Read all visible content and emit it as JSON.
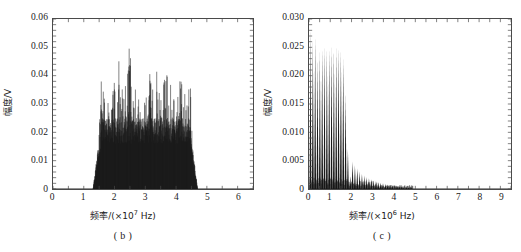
{
  "figure": {
    "background": "#ffffff",
    "axis_color": "#4a4a4a",
    "trace_color": "#1a1a1a"
  },
  "panels": [
    {
      "id": "b",
      "caption": "( b )",
      "ylabel": "幅度/V",
      "xlabel_prefix": "频率/(×10",
      "xlabel_exp": "7",
      "xlabel_suffix": " Hz)",
      "yticks": [
        "0",
        "0.01",
        "0.02",
        "0.03",
        "0.04",
        "0.05",
        "0.06"
      ],
      "xticks": [
        "0",
        "1",
        "2",
        "3",
        "4",
        "5",
        "6"
      ]
    },
    {
      "id": "c",
      "caption": "( c )",
      "ylabel": "幅度/V",
      "xlabel_prefix": "频率/(×10",
      "xlabel_exp": "6",
      "xlabel_suffix": " Hz)",
      "yticks": [
        "0",
        "0.005",
        "0.010",
        "0.015",
        "0.020",
        "0.025",
        "0.030"
      ],
      "xticks": [
        "0",
        "1",
        "2",
        "3",
        "4",
        "5",
        "6",
        "7",
        "8",
        "9"
      ]
    }
  ],
  "chart_data": [
    {
      "type": "line",
      "panel": "b",
      "title": "( b )",
      "xlabel": "频率/(×10^7 Hz)",
      "ylabel": "幅度/V",
      "xlim": [
        0,
        6.5
      ],
      "ylim": [
        0,
        0.06
      ],
      "xticks": [
        0,
        1,
        2,
        3,
        4,
        5,
        6
      ],
      "yticks": [
        0,
        0.01,
        0.02,
        0.03,
        0.04,
        0.05,
        0.06
      ],
      "grid": false,
      "legend": "none",
      "description": "Dense spectral comb occupying roughly 1.3e7 to 4.7e7 Hz with a filled noise pedestal rising near the band edges and many sharp spikes reaching 0.03-0.050 V. A slight central dip occurs near 3e7 Hz.",
      "band": [
        1.3,
        4.7
      ],
      "peak_value": 0.05,
      "peak_x": 2.52,
      "x": [
        1.3,
        1.34,
        1.38,
        1.42,
        1.46,
        1.5,
        1.54,
        1.58,
        1.62,
        1.66,
        1.7,
        1.74,
        1.78,
        1.82,
        1.86,
        1.9,
        1.94,
        1.98,
        2.02,
        2.06,
        2.1,
        2.14,
        2.18,
        2.22,
        2.26,
        2.3,
        2.34,
        2.38,
        2.42,
        2.46,
        2.5,
        2.54,
        2.58,
        2.62,
        2.66,
        2.7,
        2.74,
        2.78,
        2.82,
        2.86,
        2.9,
        2.94,
        2.98,
        3.02,
        3.06,
        3.1,
        3.14,
        3.18,
        3.22,
        3.26,
        3.3,
        3.34,
        3.38,
        3.42,
        3.46,
        3.5,
        3.54,
        3.58,
        3.62,
        3.66,
        3.7,
        3.74,
        3.78,
        3.82,
        3.86,
        3.9,
        3.94,
        3.98,
        4.02,
        4.06,
        4.1,
        4.14,
        4.18,
        4.22,
        4.26,
        4.3,
        4.34,
        4.38,
        4.42,
        4.46,
        4.5,
        4.54,
        4.58,
        4.62,
        4.66,
        4.7
      ],
      "y": [
        0.004,
        0.007,
        0.011,
        0.016,
        0.022,
        0.03,
        0.038,
        0.046,
        0.04,
        0.033,
        0.026,
        0.03,
        0.036,
        0.028,
        0.022,
        0.029,
        0.035,
        0.041,
        0.033,
        0.027,
        0.034,
        0.045,
        0.037,
        0.03,
        0.038,
        0.046,
        0.042,
        0.035,
        0.044,
        0.048,
        0.05,
        0.043,
        0.036,
        0.03,
        0.038,
        0.034,
        0.028,
        0.033,
        0.029,
        0.026,
        0.03,
        0.027,
        0.031,
        0.035,
        0.029,
        0.033,
        0.04,
        0.046,
        0.038,
        0.032,
        0.041,
        0.047,
        0.039,
        0.034,
        0.043,
        0.048,
        0.04,
        0.033,
        0.042,
        0.047,
        0.041,
        0.035,
        0.03,
        0.038,
        0.033,
        0.028,
        0.035,
        0.031,
        0.027,
        0.034,
        0.04,
        0.044,
        0.037,
        0.032,
        0.039,
        0.043,
        0.036,
        0.03,
        0.038,
        0.045,
        0.034,
        0.026,
        0.019,
        0.013,
        0.008,
        0.004
      ]
    },
    {
      "type": "line",
      "panel": "c",
      "title": "( c )",
      "xlabel": "频率/(×10^6 Hz)",
      "ylabel": "幅度/V",
      "xlim": [
        0,
        9.5
      ],
      "ylim": [
        0,
        0.03
      ],
      "xticks": [
        0,
        1,
        2,
        3,
        4,
        5,
        6,
        7,
        8,
        9
      ],
      "yticks": [
        0,
        0.005,
        0.01,
        0.015,
        0.02,
        0.025,
        0.03
      ],
      "grid": false,
      "legend": "none",
      "description": "Regular comb of harmonic spikes spaced about 0.11e6 Hz apart. Amplitudes stay near 0.023-0.028 V from 0 to roughly 1.8e6 Hz, then drop sharply, decaying through small spikes from 2 to 4e6 Hz and flattening to near zero beyond 4.5e6 Hz.",
      "peak_value": 0.0282,
      "peak_x": 0.07,
      "comb_spacing": 0.11,
      "x": [
        0.07,
        0.18,
        0.29,
        0.4,
        0.51,
        0.62,
        0.73,
        0.84,
        0.95,
        1.06,
        1.17,
        1.28,
        1.39,
        1.5,
        1.61,
        1.72,
        1.83,
        1.94,
        2.05,
        2.16,
        2.27,
        2.38,
        2.49,
        2.6,
        2.71,
        2.82,
        2.93,
        3.04,
        3.15,
        3.26,
        3.37,
        3.48,
        3.59,
        3.7,
        3.81,
        3.92,
        4.03,
        4.14,
        4.25,
        4.36,
        4.47,
        4.58,
        4.69,
        4.8
      ],
      "y": [
        0.0282,
        0.0262,
        0.0268,
        0.023,
        0.0242,
        0.0248,
        0.025,
        0.0246,
        0.0248,
        0.025,
        0.0247,
        0.0249,
        0.025,
        0.0245,
        0.0232,
        0.017,
        0.007,
        0.0022,
        0.0048,
        0.0042,
        0.0036,
        0.0031,
        0.0027,
        0.0024,
        0.0021,
        0.0019,
        0.0017,
        0.0015,
        0.0014,
        0.0012,
        0.0011,
        0.001,
        0.0009,
        0.0008,
        0.0007,
        0.0006,
        0.0006,
        0.0005,
        0.0004,
        0.0004,
        0.0003,
        0.0003,
        0.0002,
        0.0002
      ]
    }
  ]
}
